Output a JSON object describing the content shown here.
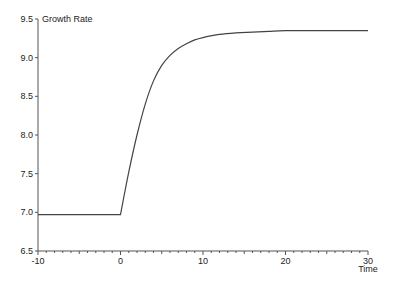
{
  "chart_data": {
    "type": "line",
    "title": "",
    "xlabel": "Time",
    "ylabel": "Growth Rate",
    "xlim": [
      -10,
      30
    ],
    "ylim": [
      6.5,
      9.5
    ],
    "grid": false,
    "legend": null,
    "x_ticks": [
      "-10",
      "0",
      "10",
      "20",
      "30"
    ],
    "y_ticks": [
      "6.5",
      "7.0",
      "7.5",
      "8.0",
      "8.5",
      "9.0",
      "9.5"
    ],
    "series": [
      {
        "name": "Growth Rate",
        "color": "#444444",
        "x": [
          -10,
          0,
          1,
          2,
          3,
          4,
          5,
          6,
          7,
          8,
          9,
          10,
          12,
          14,
          16,
          18,
          20,
          25,
          30
        ],
        "y": [
          6.97,
          6.97,
          7.52,
          8.0,
          8.4,
          8.7,
          8.9,
          9.03,
          9.12,
          9.18,
          9.23,
          9.26,
          9.3,
          9.32,
          9.33,
          9.34,
          9.35,
          9.35,
          9.35
        ]
      }
    ]
  }
}
